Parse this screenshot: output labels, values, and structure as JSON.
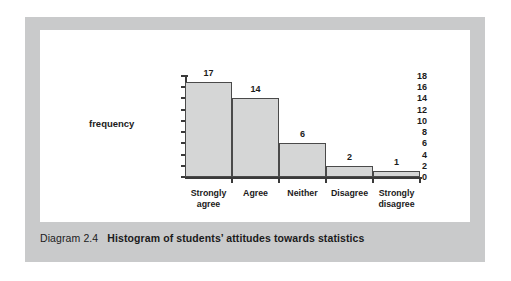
{
  "figure": {
    "caption_number": "Diagram 2.4",
    "caption_title": "Histogram of students’ attitudes towards statistics",
    "panel_color": "#c9cacb",
    "card_color": "#ffffff"
  },
  "chart_data": {
    "type": "bar",
    "title": "Histogram of students’ attitudes towards statistics",
    "xlabel": "",
    "ylabel": "frequency",
    "categories": [
      "Strongly\nagree",
      "Agree",
      "Neither",
      "Disagree",
      "Strongly\ndisagree"
    ],
    "values": [
      17,
      14,
      6,
      2,
      1
    ],
    "value_labels": [
      "17",
      "14",
      "6",
      "2",
      "1"
    ],
    "ylim": [
      0,
      18
    ],
    "ytick_step": 2,
    "ytick_labels": [
      "18",
      "16",
      "14",
      "12",
      "10",
      "8",
      "6",
      "4",
      "2",
      "0"
    ],
    "ytick_values": [
      18,
      16,
      14,
      12,
      10,
      8,
      6,
      4,
      2,
      0
    ],
    "grid": false,
    "legend": "none",
    "bar_fill": "#d5d6d6",
    "bar_edge": "#4a4a4a",
    "axis_color": "#3a3a3a"
  }
}
